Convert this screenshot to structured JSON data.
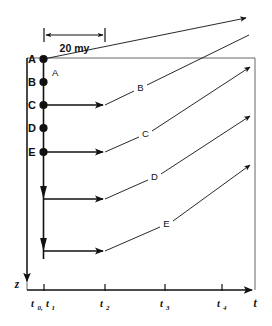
{
  "figure": {
    "type": "thermal-history-time-depth-diagram",
    "scalebar": {
      "label": "20 my",
      "from_tick": "t0,t1",
      "to_tick": "t2"
    },
    "axes": {
      "x": {
        "label": "t",
        "ticks": [
          {
            "id": "t0t1",
            "label": "t",
            "sub": "0,",
            "label2": "t",
            "sub2": "1",
            "text": "t0,t1"
          },
          {
            "id": "t2",
            "label": "t",
            "sub": "2",
            "text": "t2"
          },
          {
            "id": "t3",
            "label": "t",
            "sub": "3",
            "text": "t3"
          },
          {
            "id": "t4",
            "label": "t",
            "sub": "4",
            "text": "t4"
          }
        ]
      },
      "y": {
        "label": "z",
        "direction": "downward"
      }
    },
    "left_axis_points": [
      {
        "id": "A",
        "label": "A"
      },
      {
        "id": "B",
        "label": "B"
      },
      {
        "id": "C",
        "label": "C"
      },
      {
        "id": "D",
        "label": "D"
      },
      {
        "id": "E",
        "label": "E"
      }
    ],
    "path_labels": [
      {
        "id": "A",
        "label": "A"
      },
      {
        "id": "B",
        "label": "B"
      },
      {
        "id": "C",
        "label": "C"
      },
      {
        "id": "D",
        "label": "D"
      },
      {
        "id": "E",
        "label": "E"
      }
    ],
    "colors": {
      "ink": "#111111",
      "box": "#555555",
      "background": "#ffffff"
    }
  }
}
